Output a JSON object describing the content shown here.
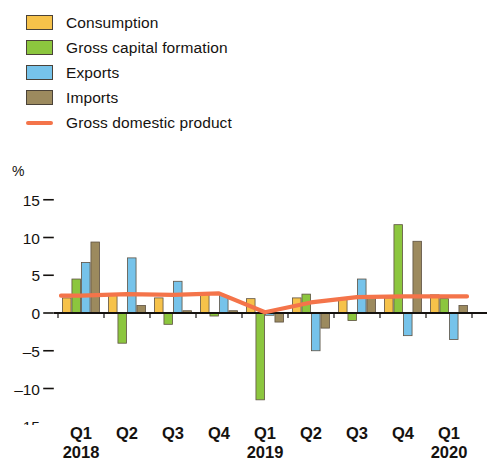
{
  "legend": {
    "items": [
      {
        "label": "Consumption",
        "color": "#f6c24a",
        "type": "swatch",
        "icon": "square-swatch-icon"
      },
      {
        "label": "Gross capital formation",
        "color": "#8cc63e",
        "type": "swatch",
        "icon": "square-swatch-icon"
      },
      {
        "label": "Exports",
        "color": "#76c3ea",
        "type": "swatch",
        "icon": "square-swatch-icon"
      },
      {
        "label": "Imports",
        "color": "#9c8a5e",
        "type": "swatch",
        "icon": "square-swatch-icon"
      },
      {
        "label": "Gross domestic product",
        "color": "#f4744a",
        "type": "line",
        "icon": "line-swatch-icon"
      }
    ]
  },
  "axis": {
    "unit": "%",
    "y_ticks": [
      "15",
      "10",
      "5",
      "0",
      "–5",
      "–10",
      "–15"
    ],
    "x_quarters": [
      "Q1",
      "Q2",
      "Q3",
      "Q4",
      "Q1",
      "Q2",
      "Q3",
      "Q4",
      "Q1"
    ],
    "x_years": [
      "2018",
      "",
      "",
      "",
      "2019",
      "",
      "",
      "",
      "2020"
    ]
  },
  "chart_data": {
    "type": "bar",
    "title": "",
    "subtitle": "",
    "xlabel": "",
    "ylabel": "%",
    "ylim": [
      -15,
      15
    ],
    "ytick_values": [
      15,
      10,
      5,
      0,
      -5,
      -10,
      -15
    ],
    "grid": false,
    "legend_position": "top-left",
    "categories": [
      "Q1 2018",
      "Q2 2018",
      "Q3 2018",
      "Q4 2018",
      "Q1 2019",
      "Q2 2019",
      "Q3 2019",
      "Q4 2019",
      "Q1 2020"
    ],
    "series": [
      {
        "name": "Consumption",
        "color": "#f6c24a",
        "kind": "bar",
        "values": [
          2.0,
          2.3,
          2.0,
          2.7,
          1.9,
          2.0,
          1.9,
          2.0,
          2.4
        ]
      },
      {
        "name": "Gross capital formation",
        "color": "#8cc63e",
        "kind": "bar",
        "values": [
          4.5,
          -4.0,
          -1.5,
          -0.4,
          -11.5,
          2.5,
          -1.0,
          11.7,
          1.9
        ]
      },
      {
        "name": "Exports",
        "color": "#76c3ea",
        "kind": "bar",
        "values": [
          6.7,
          7.3,
          4.2,
          2.3,
          -0.3,
          -5.0,
          4.5,
          -3.0,
          -3.5
        ]
      },
      {
        "name": "Imports",
        "color": "#9c8a5e",
        "kind": "bar",
        "values": [
          9.4,
          1.0,
          0.3,
          0.3,
          -1.2,
          -2.0,
          2.0,
          9.5,
          1.0
        ]
      },
      {
        "name": "Gross domestic product",
        "color": "#f4744a",
        "kind": "line",
        "values": [
          2.3,
          2.5,
          2.4,
          2.6,
          0.1,
          1.4,
          2.1,
          2.2,
          2.2
        ]
      }
    ]
  }
}
